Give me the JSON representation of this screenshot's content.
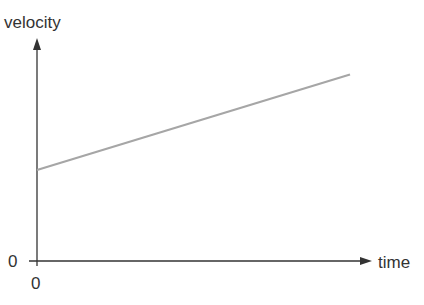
{
  "chart_data": {
    "type": "line",
    "title": "",
    "xlabel": "time",
    "ylabel": "velocity",
    "x_origin_label": "0",
    "y_origin_label": "0",
    "grid": false,
    "legend": null,
    "series": [
      {
        "name": "velocity vs time",
        "color": "#a6a6a6",
        "points": [
          {
            "x": 0,
            "y": 0.41
          },
          {
            "x": 1,
            "y": 0.84
          }
        ],
        "description": "straight line with positive slope and nonzero initial velocity (constant acceleration)"
      }
    ],
    "axis_color": "#333333"
  }
}
